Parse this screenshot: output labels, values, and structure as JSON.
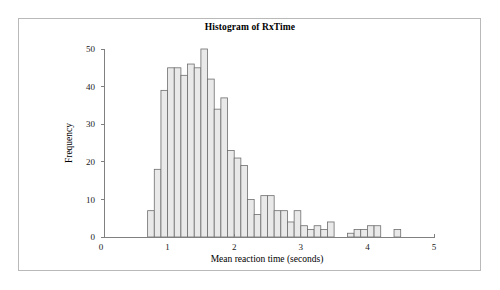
{
  "figure": {
    "title": "Histogram of RxTime",
    "frame_color": "#b9b9b9",
    "background": "#ffffff"
  },
  "chart_data": {
    "type": "bar",
    "title": "Histogram of RxTime",
    "subtitle": "",
    "xlabel": "Mean reaction time (seconds)",
    "ylabel": "Frequency",
    "xlim": [
      0,
      5
    ],
    "ylim": [
      0,
      50
    ],
    "xticks": [
      0,
      1,
      2,
      3,
      4,
      5
    ],
    "xtick_labels": [
      "0",
      "1",
      "2",
      "3",
      "4",
      "5"
    ],
    "yticks": [
      0,
      10,
      20,
      30,
      40,
      50
    ],
    "ytick_labels": [
      "0",
      "10",
      "20",
      "30",
      "40",
      "50"
    ],
    "grid": false,
    "legend": false,
    "bar_fill": "#e9e9e9",
    "bar_edge": "#6e6e6e",
    "bin_width": 0.1,
    "bin_starts": [
      0.7,
      0.8,
      0.9,
      1.0,
      1.1,
      1.2,
      1.3,
      1.4,
      1.5,
      1.6,
      1.7,
      1.8,
      1.9,
      2.0,
      2.1,
      2.2,
      2.3,
      2.4,
      2.5,
      2.6,
      2.7,
      2.8,
      2.9,
      3.0,
      3.1,
      3.2,
      3.3,
      3.4,
      3.7,
      3.8,
      3.9,
      4.0,
      4.1,
      4.4
    ],
    "values": [
      7,
      18,
      39,
      45,
      45,
      43,
      46,
      45,
      50,
      42,
      34,
      37,
      23,
      21,
      19,
      10,
      6,
      11,
      11,
      7,
      7,
      4,
      7,
      3,
      2,
      3,
      2,
      4,
      1,
      2,
      2,
      3,
      3,
      2
    ],
    "categories": [
      "0.7",
      "0.8",
      "0.9",
      "1.0",
      "1.1",
      "1.2",
      "1.3",
      "1.4",
      "1.5",
      "1.6",
      "1.7",
      "1.8",
      "1.9",
      "2.0",
      "2.1",
      "2.2",
      "2.3",
      "2.4",
      "2.5",
      "2.6",
      "2.7",
      "2.8",
      "2.9",
      "3.0",
      "3.1",
      "3.2",
      "3.3",
      "3.4",
      "3.7",
      "3.8",
      "3.9",
      "4.0",
      "4.1",
      "4.4"
    ]
  }
}
